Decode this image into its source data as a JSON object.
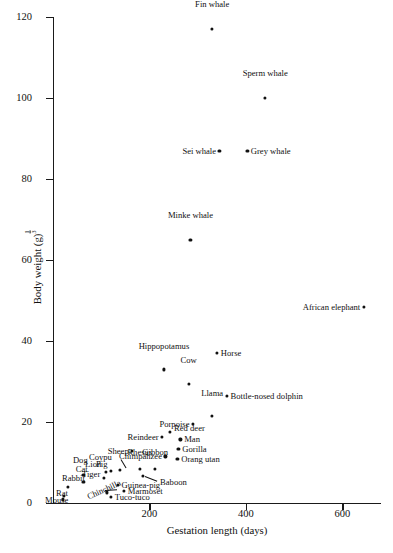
{
  "figure": {
    "background": "#ffffff",
    "ink": "#111111"
  },
  "chart_data": {
    "type": "scatter",
    "title": "",
    "xlabel": "Gestation length (days)",
    "ylabel": "Body weight (g)",
    "ylabel_exponent": "1/3",
    "xlim": [
      0,
      680
    ],
    "ylim": [
      0,
      120
    ],
    "xticks": [
      200,
      400,
      600
    ],
    "yticks": [
      0,
      20,
      40,
      60,
      80,
      100,
      120
    ],
    "grid": false,
    "legend": "none",
    "xtick_labels": [
      "200",
      "400",
      "600"
    ],
    "ytick_labels": [
      "0",
      "20",
      "40",
      "60",
      "80",
      "100",
      "120"
    ],
    "points": [
      {
        "label": "Fin whale",
        "x": 330,
        "y": 117,
        "lx": 330,
        "ly": 122,
        "pos": "c"
      },
      {
        "label": "Sperm whale",
        "x": 440,
        "y": 100,
        "lx": 440,
        "ly": 105,
        "pos": "c"
      },
      {
        "label": "Sei whale",
        "x": 345,
        "y": 87,
        "lx": 338,
        "ly": 87,
        "pos": "r"
      },
      {
        "label": "Grey whale",
        "x": 403,
        "y": 87,
        "lx": 410,
        "ly": 87,
        "pos": "l"
      },
      {
        "label": "Minke whale",
        "x": 285,
        "y": 65,
        "lx": 285,
        "ly": 70,
        "pos": "c"
      },
      {
        "label": "African elephant",
        "x": 645,
        "y": 48.5,
        "lx": 637,
        "ly": 48.5,
        "pos": "r"
      },
      {
        "label": "Horse",
        "x": 340,
        "y": 37,
        "lx": 348,
        "ly": 37,
        "pos": "l"
      },
      {
        "label": "Hippopotamus",
        "x": 230,
        "y": 33,
        "lx": 230,
        "ly": 37.5,
        "pos": "c"
      },
      {
        "label": "Cow",
        "x": 281,
        "y": 29.5,
        "lx": 281,
        "ly": 34,
        "pos": "c"
      },
      {
        "label": "Bottle-nosed dolphin",
        "x": 360,
        "y": 26.5,
        "lx": 368,
        "ly": 26.5,
        "pos": "l"
      },
      {
        "label": "Llama",
        "x": 330,
        "y": 21.5,
        "lx": 330,
        "ly": 26,
        "pos": "c"
      },
      {
        "label": "Porpoise",
        "x": 290,
        "y": 19.5,
        "lx": 283,
        "ly": 19.5,
        "pos": "r"
      },
      {
        "label": "Red deer",
        "x": 243,
        "y": 17.5,
        "lx": 251,
        "ly": 18.6,
        "pos": "l"
      },
      {
        "label": "Reindeer",
        "x": 226,
        "y": 16.3,
        "lx": 219,
        "ly": 16.3,
        "pos": "r"
      },
      {
        "label": "Man",
        "x": 264,
        "y": 15.7,
        "lx": 272,
        "ly": 15.7,
        "pos": "l"
      },
      {
        "label": "Gorilla",
        "x": 260,
        "y": 13.3,
        "lx": 268,
        "ly": 13.3,
        "pos": "l"
      },
      {
        "label": "Sheep",
        "x": 164,
        "y": 12.9,
        "lx": 157,
        "ly": 12.9,
        "pos": "r"
      },
      {
        "label": "Chimpanzee",
        "x": 233,
        "y": 11.5,
        "lx": 226,
        "ly": 11.5,
        "pos": "r"
      },
      {
        "label": "Orang utan",
        "x": 258,
        "y": 10.8,
        "lx": 266,
        "ly": 10.8,
        "pos": "l"
      },
      {
        "label": "Coypu",
        "x": 139,
        "y": 8.2,
        "lx": 122,
        "ly": 11.4,
        "pos": "r"
      },
      {
        "label": "Rhesus",
        "x": 180,
        "y": 8.4,
        "lx": 180,
        "ly": 11.3,
        "pos": "c"
      },
      {
        "label": "Gibbon",
        "x": 212,
        "y": 8.5,
        "lx": 212,
        "ly": 11.3,
        "pos": "c"
      },
      {
        "label": "Pig",
        "x": 120,
        "y": 8.0,
        "lx": 113,
        "ly": 9.7,
        "pos": "r"
      },
      {
        "label": "Lion",
        "x": 110,
        "y": 7.6,
        "lx": 100,
        "ly": 9.7,
        "pos": "r"
      },
      {
        "label": "Dog",
        "x": 63,
        "y": 7.0,
        "lx": 72,
        "ly": 10.6,
        "pos": "r"
      },
      {
        "label": "Tiger",
        "x": 105,
        "y": 6.2,
        "lx": 98,
        "ly": 7.2,
        "pos": "r"
      },
      {
        "label": "Cat",
        "x": 63,
        "y": 5.3,
        "lx": 72,
        "ly": 8.3,
        "pos": "r"
      },
      {
        "label": "Baboon",
        "x": 187,
        "y": 6.6,
        "lx": 222,
        "ly": 5.2,
        "pos": "l"
      },
      {
        "label": "Guinea-pig",
        "x": 134,
        "y": 4.4,
        "lx": 142,
        "ly": 4.4,
        "pos": "l"
      },
      {
        "label": "Rabbit",
        "x": 31,
        "y": 4.0,
        "lx": 66,
        "ly": 6.2,
        "pos": "r"
      },
      {
        "label": "Marmoset",
        "x": 147,
        "y": 2.9,
        "lx": 155,
        "ly": 2.9,
        "pos": "l"
      },
      {
        "label": "Chinchilla",
        "x": 111,
        "y": 2.6,
        "lx": 105,
        "ly": 3.2,
        "pos": "rot"
      },
      {
        "label": "Tuco-tuco",
        "x": 120,
        "y": 1.5,
        "lx": 128,
        "ly": 1.5,
        "pos": "l"
      },
      {
        "label": "Rat",
        "x": 22,
        "y": 1.8,
        "lx": 31,
        "ly": 2.4,
        "pos": "r"
      },
      {
        "label": "Mouse",
        "x": 20,
        "y": 0.9,
        "lx": 32,
        "ly": 0.7,
        "pos": "r"
      }
    ],
    "leaders": [
      {
        "from_label": "Coypu",
        "x1": 141,
        "y1": 10.8,
        "x2": 152,
        "y2": 8.6
      },
      {
        "from_label": "Baboon",
        "x1": 190,
        "y1": 6.6,
        "x2": 216,
        "y2": 5.4
      },
      {
        "from_label": "Chinchilla",
        "x1": 108,
        "y1": 3.3,
        "x2": 132,
        "y2": 3.5
      }
    ]
  }
}
